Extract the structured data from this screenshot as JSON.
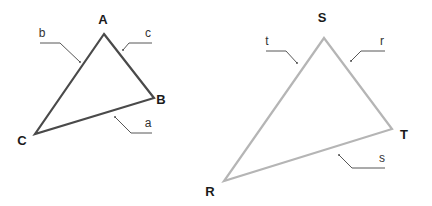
{
  "colors": {
    "triangle1_stroke": "#4a4a4a",
    "triangle2_stroke": "#b5b5b5",
    "leader": "#444444",
    "label": "#1a1a1a",
    "background": "#ffffff"
  },
  "triangles": [
    {
      "name": "ABC",
      "vertices": {
        "A": {
          "label": "A",
          "x": 104,
          "y": 34,
          "lx": 103,
          "ly": 24
        },
        "B": {
          "label": "B",
          "x": 154,
          "y": 98,
          "lx": 161,
          "ly": 104
        },
        "C": {
          "label": "C",
          "x": 35,
          "y": 134,
          "lx": 22,
          "ly": 145
        }
      },
      "sides": {
        "a": {
          "label": "a",
          "lx": 147,
          "ly": 127
        },
        "b": {
          "label": "b",
          "lx": 40,
          "ly": 37
        },
        "c": {
          "label": "c",
          "lx": 148,
          "ly": 37
        }
      }
    },
    {
      "name": "RST",
      "vertices": {
        "S": {
          "label": "S",
          "x": 324,
          "y": 38,
          "lx": 322,
          "ly": 22
        },
        "T": {
          "label": "T",
          "x": 392,
          "y": 129,
          "lx": 403,
          "ly": 139
        },
        "R": {
          "label": "R",
          "x": 224,
          "y": 181,
          "lx": 210,
          "ly": 195
        }
      },
      "sides": {
        "r": {
          "label": "r",
          "lx": 380,
          "ly": 44
        },
        "s": {
          "label": "s",
          "lx": 381,
          "ly": 162
        },
        "t": {
          "label": "t",
          "lx": 266,
          "ly": 44
        }
      }
    }
  ]
}
